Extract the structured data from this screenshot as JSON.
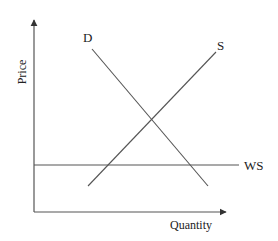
{
  "diagram": {
    "type": "supply-demand",
    "axes": {
      "y_label": "Price",
      "x_label": "Quantity",
      "origin": [
        34,
        212
      ],
      "y_axis_top": [
        34,
        19
      ],
      "x_axis_right": [
        227,
        212
      ]
    },
    "curves": [
      {
        "label": "D",
        "from": [
          92,
          49
        ],
        "to": [
          208,
          186
        ],
        "label_pos": [
          85,
          41
        ]
      },
      {
        "label": "S",
        "from": [
          88,
          186
        ],
        "to": [
          216,
          52
        ],
        "label_pos": [
          220,
          49
        ]
      },
      {
        "label": "WS",
        "from": [
          34,
          165
        ],
        "to": [
          239,
          165
        ],
        "label_pos": [
          244,
          169
        ]
      }
    ],
    "intersection": [
      151,
      121
    ],
    "colors": {
      "line": "#555555",
      "text": "#222222",
      "background": "#ffffff"
    }
  }
}
